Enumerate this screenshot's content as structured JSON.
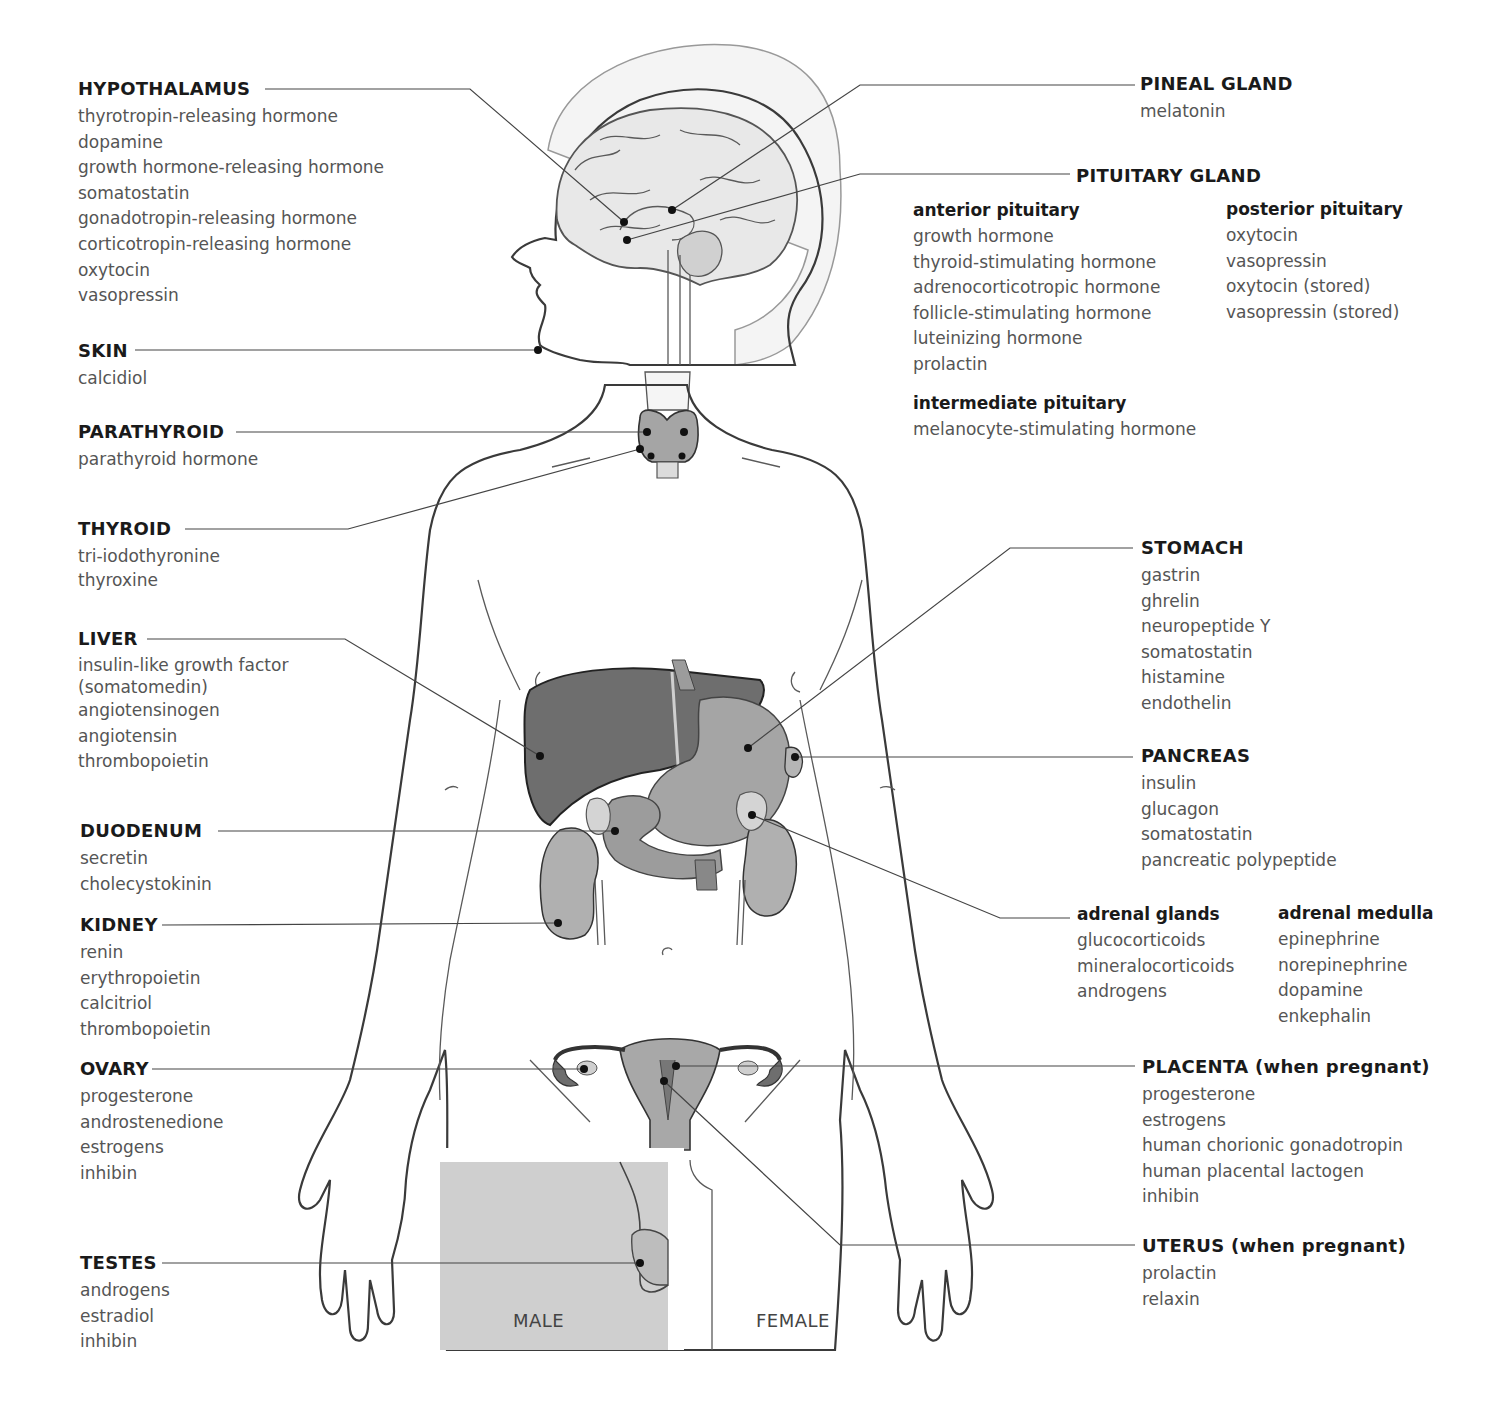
{
  "diagram": {
    "sex_labels": {
      "male": "MALE",
      "female": "FEMALE"
    },
    "colors": {
      "skin": "#e3e3e3",
      "outline": "#3a3a3a",
      "organ_dark": "#6e6e6e",
      "organ_mid": "#9c9c9c",
      "organ_light": "#bdbdbd",
      "male_panel": "#cfcfcf",
      "leader": "#444444"
    }
  },
  "glands": {
    "hypothalamus": {
      "name": "HYPOTHALAMUS",
      "hormones": [
        "thyrotropin-releasing hormone",
        "dopamine",
        "growth hormone-releasing hormone",
        "somatostatin",
        "gonadotropin-releasing hormone",
        "corticotropin-releasing hormone",
        "oxytocin",
        "vasopressin"
      ]
    },
    "skin": {
      "name": "SKIN",
      "hormones": [
        "calcidiol"
      ]
    },
    "parathyroid": {
      "name": "PARATHYROID",
      "hormones": [
        "parathyroid hormone"
      ]
    },
    "thyroid": {
      "name": "THYROID",
      "hormones": [
        "tri-iodothyronine",
        "thyroxine"
      ]
    },
    "liver": {
      "name": "LIVER",
      "hormones": [
        "insulin-like growth factor",
        "(somatomedin)",
        "angiotensinogen",
        "angiotensin",
        "thrombopoietin"
      ]
    },
    "duodenum": {
      "name": "DUODENUM",
      "hormones": [
        "secretin",
        "cholecystokinin"
      ]
    },
    "kidney": {
      "name": "KIDNEY",
      "hormones": [
        "renin",
        "erythropoietin",
        "calcitriol",
        "thrombopoietin"
      ]
    },
    "ovary": {
      "name": "OVARY",
      "hormones": [
        "progesterone",
        "androstenedione",
        "estrogens",
        "inhibin"
      ]
    },
    "testes": {
      "name": "TESTES",
      "hormones": [
        "androgens",
        "estradiol",
        "inhibin"
      ]
    },
    "pineal": {
      "name": "PINEAL GLAND",
      "hormones": [
        "melatonin"
      ]
    },
    "pituitary": {
      "name": "PITUITARY GLAND",
      "anterior": {
        "name": "anterior pituitary",
        "hormones": [
          "growth hormone",
          "thyroid-stimulating hormone",
          "adrenocorticotropic hormone",
          "follicle-stimulating hormone",
          "luteinizing hormone",
          "prolactin"
        ]
      },
      "posterior": {
        "name": "posterior pituitary",
        "hormones": [
          "oxytocin",
          "vasopressin",
          "oxytocin (stored)",
          "vasopressin (stored)"
        ]
      },
      "intermediate": {
        "name": "intermediate pituitary",
        "hormones": [
          "melanocyte-stimulating hormone"
        ]
      }
    },
    "stomach": {
      "name": "STOMACH",
      "hormones": [
        "gastrin",
        "ghrelin",
        "neuropeptide Y",
        "somatostatin",
        "histamine",
        "endothelin"
      ]
    },
    "pancreas": {
      "name": "PANCREAS",
      "hormones": [
        "insulin",
        "glucagon",
        "somatostatin",
        "pancreatic polypeptide"
      ]
    },
    "adrenal": {
      "glands": {
        "name": "adrenal glands",
        "hormones": [
          "glucocorticoids",
          "mineralocorticoids",
          "androgens"
        ]
      },
      "medulla": {
        "name": "adrenal medulla",
        "hormones": [
          "epinephrine",
          "norepinephrine",
          "dopamine",
          "enkephalin"
        ]
      }
    },
    "placenta": {
      "name": "PLACENTA (when pregnant)",
      "hormones": [
        "progesterone",
        "estrogens",
        "human chorionic gonadotropin",
        "human placental lactogen",
        "inhibin"
      ]
    },
    "uterus": {
      "name": "UTERUS (when pregnant)",
      "hormones": [
        "prolactin",
        "relaxin"
      ]
    }
  }
}
